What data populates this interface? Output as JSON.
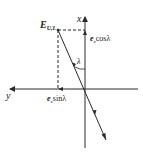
{
  "diagram": {
    "type": "vector-decomposition",
    "colors": {
      "stroke": "#2a2a2a",
      "background": "#ffffff"
    },
    "axes": {
      "x_label": "x",
      "y_label": "y"
    },
    "point_label": {
      "main": "E",
      "subscript": "U,L"
    },
    "angle_label": "λ",
    "components": {
      "vertical": {
        "vector": "e",
        "subscript": "x",
        "func": "cosλ"
      },
      "horizontal": {
        "vector": "e",
        "subscript": "x",
        "func": "sinλ"
      }
    }
  }
}
